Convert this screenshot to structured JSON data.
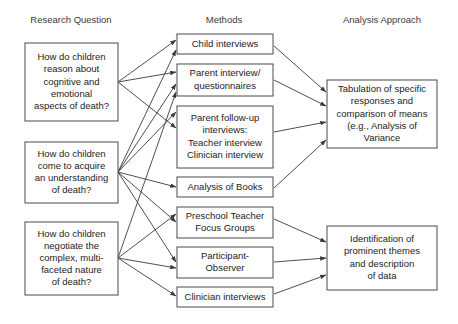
{
  "figure": {
    "background_color": "#ffffff",
    "box_border_color": "#4a4a4a",
    "text_color": "#1c1c1c",
    "arrow_color": "#3b3b3b"
  },
  "columns": {
    "left": {
      "header": "Research Question",
      "center_x": 71
    },
    "middle": {
      "header": "Methods",
      "center_x": 224
    },
    "right": {
      "header": "Analysis Approach",
      "center_x": 382
    }
  },
  "research_questions": [
    {
      "id": "rq1",
      "lines": [
        "How do children",
        "reason about",
        "cognitive and",
        "emotional",
        "aspects of death?"
      ],
      "box": {
        "x": 25,
        "y": 43,
        "w": 93,
        "h": 78
      },
      "anchor": {
        "x": 118,
        "y": 82
      }
    },
    {
      "id": "rq2",
      "lines": [
        "How do children",
        "come to acquire",
        "an understanding",
        "of death?"
      ],
      "box": {
        "x": 25,
        "y": 142,
        "w": 93,
        "h": 61
      },
      "anchor": {
        "x": 118,
        "y": 172
      }
    },
    {
      "id": "rq3",
      "lines": [
        "How do children",
        "negotiate the",
        "complex, multi-",
        "faceted nature",
        "of death?"
      ],
      "box": {
        "x": 25,
        "y": 222,
        "w": 93,
        "h": 73
      },
      "anchor": {
        "x": 118,
        "y": 258
      }
    }
  ],
  "methods": [
    {
      "id": "m1",
      "lines": [
        "Child interviews"
      ],
      "box": {
        "x": 177,
        "y": 34,
        "w": 96,
        "h": 20
      }
    },
    {
      "id": "m2",
      "lines": [
        "Parent interview/",
        "questionnaires"
      ],
      "box": {
        "x": 177,
        "y": 64,
        "w": 96,
        "h": 32
      }
    },
    {
      "id": "m3",
      "lines": [
        "Parent follow-up",
        "interviews:",
        "Teacher interview",
        "Clinician interview"
      ],
      "box": {
        "x": 177,
        "y": 106,
        "w": 96,
        "h": 62
      }
    },
    {
      "id": "m4",
      "lines": [
        "Analysis of Books"
      ],
      "box": {
        "x": 177,
        "y": 177,
        "w": 96,
        "h": 20
      }
    },
    {
      "id": "m5",
      "lines": [
        "Preschool Teacher",
        "Focus Groups"
      ],
      "box": {
        "x": 177,
        "y": 207,
        "w": 96,
        "h": 31
      }
    },
    {
      "id": "m6",
      "lines": [
        "Participant-",
        "Observer"
      ],
      "box": {
        "x": 177,
        "y": 247,
        "w": 96,
        "h": 31
      }
    },
    {
      "id": "m7",
      "lines": [
        "Clinician interviews"
      ],
      "box": {
        "x": 177,
        "y": 287,
        "w": 96,
        "h": 20
      }
    }
  ],
  "analyses": [
    {
      "id": "a1",
      "lines": [
        "Tabulation of specific",
        "responses and",
        "comparison of means",
        "(e.g., Analysis of",
        "Variance"
      ],
      "box": {
        "x": 327,
        "y": 80,
        "w": 110,
        "h": 68
      }
    },
    {
      "id": "a2",
      "lines": [
        "Identification of",
        "prominent themes",
        "and description",
        "of data"
      ],
      "box": {
        "x": 327,
        "y": 226,
        "w": 110,
        "h": 64
      }
    }
  ],
  "edges": [
    {
      "from": "rq1",
      "to": "m1",
      "x1": 118,
      "y1": 82,
      "x2": 176,
      "y2": 40
    },
    {
      "from": "rq1",
      "to": "m2",
      "x1": 118,
      "y1": 82,
      "x2": 176,
      "y2": 72
    },
    {
      "from": "rq1",
      "to": "m3",
      "x1": 118,
      "y1": 82,
      "x2": 176,
      "y2": 128
    },
    {
      "from": "rq2",
      "to": "m1",
      "x1": 118,
      "y1": 172,
      "x2": 176,
      "y2": 50
    },
    {
      "from": "rq2",
      "to": "m2",
      "x1": 118,
      "y1": 172,
      "x2": 176,
      "y2": 84
    },
    {
      "from": "rq2",
      "to": "m3",
      "x1": 118,
      "y1": 172,
      "x2": 176,
      "y2": 112
    },
    {
      "from": "rq2",
      "to": "m4",
      "x1": 118,
      "y1": 172,
      "x2": 176,
      "y2": 187
    },
    {
      "from": "rq2",
      "to": "m5",
      "x1": 118,
      "y1": 172,
      "x2": 176,
      "y2": 222
    },
    {
      "from": "rq2",
      "to": "m6",
      "x1": 118,
      "y1": 172,
      "x2": 176,
      "y2": 262
    },
    {
      "from": "rq3",
      "to": "m2",
      "x1": 118,
      "y1": 258,
      "x2": 176,
      "y2": 92
    },
    {
      "from": "rq3",
      "to": "m5",
      "x1": 118,
      "y1": 258,
      "x2": 176,
      "y2": 214
    },
    {
      "from": "rq3",
      "to": "m6",
      "x1": 118,
      "y1": 258,
      "x2": 176,
      "y2": 268
    },
    {
      "from": "rq3",
      "to": "m7",
      "x1": 118,
      "y1": 258,
      "x2": 176,
      "y2": 296
    },
    {
      "from": "m1",
      "to": "a1",
      "x1": 274,
      "y1": 46,
      "x2": 326,
      "y2": 92
    },
    {
      "from": "m2",
      "to": "a1",
      "x1": 274,
      "y1": 80,
      "x2": 326,
      "y2": 106
    },
    {
      "from": "m3",
      "to": "a1",
      "x1": 274,
      "y1": 132,
      "x2": 326,
      "y2": 122
    },
    {
      "from": "m4",
      "to": "a1",
      "x1": 274,
      "y1": 188,
      "x2": 326,
      "y2": 140
    },
    {
      "from": "m5",
      "to": "a2",
      "x1": 274,
      "y1": 219,
      "x2": 326,
      "y2": 242
    },
    {
      "from": "m6",
      "to": "a2",
      "x1": 274,
      "y1": 262,
      "x2": 326,
      "y2": 258
    },
    {
      "from": "m7",
      "to": "a2",
      "x1": 274,
      "y1": 294,
      "x2": 326,
      "y2": 275
    }
  ]
}
